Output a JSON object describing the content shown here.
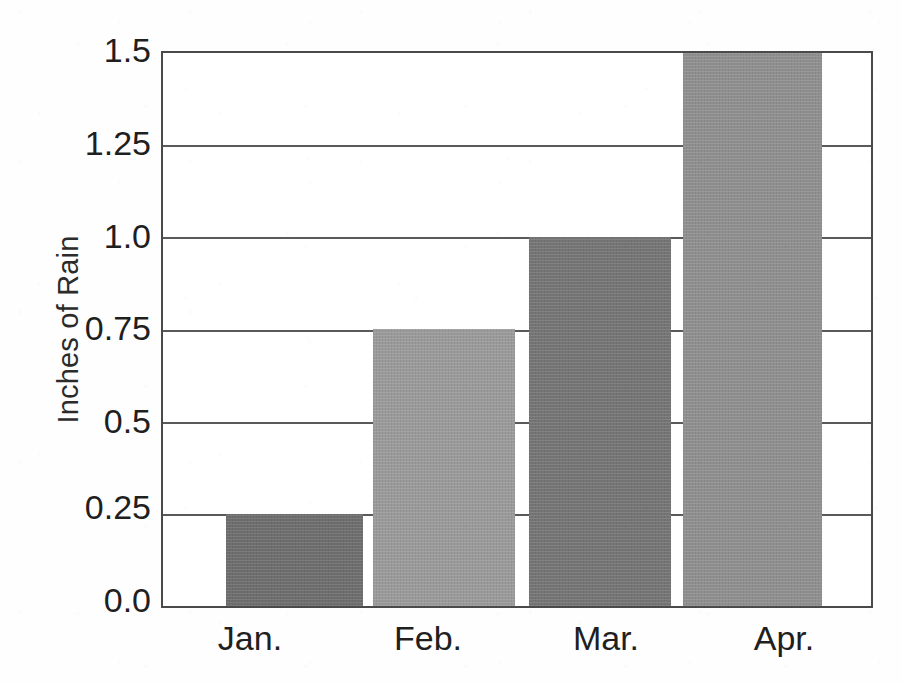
{
  "chart_data": {
    "type": "bar",
    "title": "",
    "subtitle": "",
    "xlabel": "",
    "ylabel": "Inches of Rain",
    "categories": [
      "Jan.",
      "Feb.",
      "Mar.",
      "Apr."
    ],
    "values": [
      0.25,
      0.75,
      1.0,
      1.5
    ],
    "series": [
      {
        "name": "Inches of Rain",
        "values": [
          0.25,
          0.75,
          1.0,
          1.5
        ]
      }
    ],
    "ylim": [
      0.0,
      1.5
    ],
    "ytick_labels": [
      "1.5",
      "1.25",
      "1.0",
      "0.75",
      "0.5",
      "0.25",
      "0.0"
    ],
    "ytick_values": [
      1.5,
      1.25,
      1.0,
      0.75,
      0.5,
      0.25,
      0.0
    ],
    "grid": true,
    "grid_axis": "y",
    "legend": false,
    "legend_position": "none",
    "bar_colors": [
      "#6e6e6e",
      "#9a9a9a",
      "#757575",
      "#8f8f8f"
    ],
    "annotations": [],
    "axis_color": "#4a4a4a",
    "grid_color": "#5a5a5a",
    "text_color": "#1f1f1f",
    "background": "#ffffff"
  }
}
